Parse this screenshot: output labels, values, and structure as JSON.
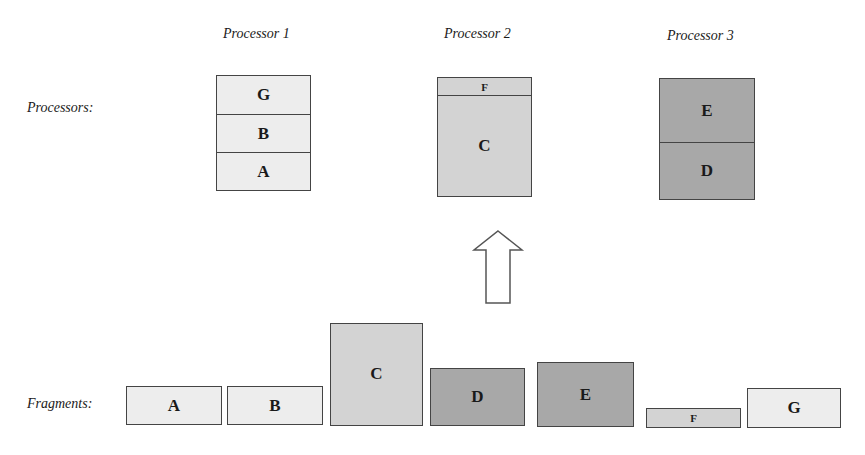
{
  "labels": {
    "processors_row": "Processors:",
    "fragments_row": "Fragments:"
  },
  "processors": [
    {
      "title": "Processor 1",
      "segments": [
        "G",
        "B",
        "A"
      ]
    },
    {
      "title": "Processor 2",
      "segments": [
        "F",
        "C"
      ]
    },
    {
      "title": "Processor 3",
      "segments": [
        "E",
        "D"
      ]
    }
  ],
  "fragments": [
    {
      "label": "A",
      "shade": "light"
    },
    {
      "label": "B",
      "shade": "light"
    },
    {
      "label": "C",
      "shade": "medium"
    },
    {
      "label": "D",
      "shade": "dark"
    },
    {
      "label": "E",
      "shade": "dark"
    },
    {
      "label": "F",
      "shade": "medium"
    },
    {
      "label": "G",
      "shade": "light"
    }
  ],
  "arrow": {
    "direction": "up",
    "icon": "hollow-up-arrow-icon"
  },
  "colors": {
    "light": "#ededed",
    "medium": "#d3d3d3",
    "dark": "#a8a8a8",
    "border": "#444444"
  }
}
